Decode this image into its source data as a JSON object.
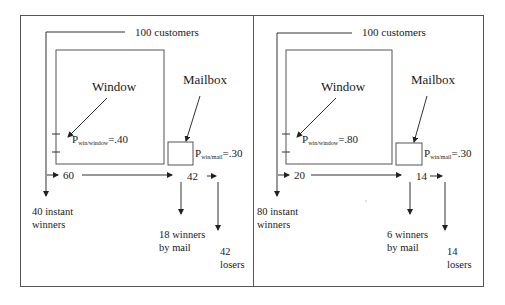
{
  "panels": [
    {
      "customers_label": "100 customers",
      "window_label": "Window",
      "mailbox_label": "Mailbox",
      "p_window": {
        "symbol": "P",
        "subscript": "win/window",
        "value": "=.40"
      },
      "p_mail": {
        "symbol": "P",
        "subscript": "win/mail",
        "value": "=.30"
      },
      "to_mailbox_count": "60",
      "after_mailbox_count": "42",
      "instant_winners": [
        "40 instant",
        "winners"
      ],
      "mail_winners": [
        "18 winners",
        "by mail"
      ],
      "losers": [
        "42",
        "losers"
      ]
    },
    {
      "customers_label": "100 customers",
      "window_label": "Window",
      "mailbox_label": "Mailbox",
      "p_window": {
        "symbol": "P",
        "subscript": "win/window",
        "value": "=.80"
      },
      "p_mail": {
        "symbol": "P",
        "subscript": "win/mail",
        "value": "=.30"
      },
      "to_mailbox_count": "20",
      "after_mailbox_count": "14",
      "instant_winners": [
        "80 instant",
        "winners"
      ],
      "mail_winners": [
        "6 winners",
        "by mail"
      ],
      "losers": [
        "14",
        "losers"
      ]
    }
  ],
  "colors": {
    "line": "#333333",
    "border": "#555555",
    "text": "#1a1a1a"
  }
}
